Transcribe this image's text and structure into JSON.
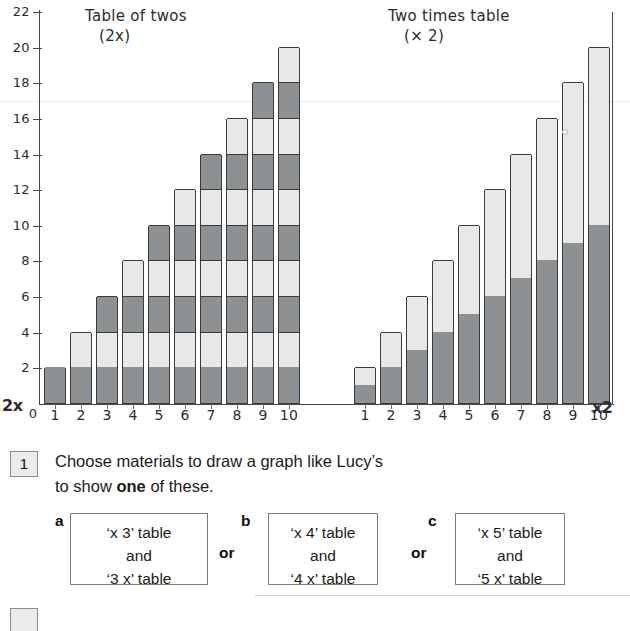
{
  "chart_data": {
    "type": "bar",
    "panels": [
      {
        "title_line1": "Table of twos",
        "title_line2": "(2x)",
        "axis_tag": "2x",
        "categories": [
          "1",
          "2",
          "3",
          "4",
          "5",
          "6",
          "7",
          "8",
          "9",
          "10"
        ],
        "values": [
          2,
          4,
          6,
          8,
          10,
          12,
          14,
          16,
          18,
          20
        ],
        "segment_size": 2,
        "segment_style": "alternating-blocks-of-2",
        "xlabel": "2x",
        "ylabel": "",
        "ylim": [
          0,
          22
        ]
      },
      {
        "title_line1": "Two times table",
        "title_line2": "(× 2)",
        "axis_tag": "x2",
        "categories": [
          "1",
          "2",
          "3",
          "4",
          "5",
          "6",
          "7",
          "8",
          "9",
          "10"
        ],
        "values": [
          2,
          4,
          6,
          8,
          10,
          12,
          14,
          16,
          18,
          20
        ],
        "split_at": "half",
        "segment_style": "dark-lower-half-light-upper-half",
        "xlabel": "×2",
        "ylabel": "",
        "ylim": [
          0,
          22
        ]
      }
    ],
    "yticks": [
      0,
      2,
      4,
      6,
      8,
      10,
      12,
      14,
      16,
      18,
      20,
      22
    ],
    "ytick_labels": [
      "0",
      "2",
      "4",
      "6",
      "8",
      "10",
      "12",
      "14",
      "16",
      "18",
      "20",
      "22"
    ],
    "grid": false,
    "legend": "none",
    "colors": {
      "bar_dark": "#8e9194",
      "bar_light": "#e8e9e6",
      "axis": "#4a4a4a",
      "outline": "#3b3b3b"
    }
  },
  "chart": {
    "zero_label": "0",
    "left": {
      "title_line1": "Table of twos",
      "title_line2": "(2x)",
      "axis_tag": "2x"
    },
    "right": {
      "title_line1": "Two times table",
      "title_line2": "(× 2)",
      "axis_tag": "x2"
    }
  },
  "question": {
    "number": "1",
    "text_line1": "Choose materials to draw a graph like Lucy’s",
    "text_line2_pre": "to show ",
    "text_line2_bold": "one",
    "text_line2_post": " of these.",
    "or_label_1": "or",
    "or_label_2": "or",
    "options": [
      {
        "letter": "a",
        "line1": "‘x 3’ table",
        "line2": "and",
        "line3": "‘3 x’ table"
      },
      {
        "letter": "b",
        "line1": "‘x 4’ table",
        "line2": "and",
        "line3": "‘4 x’ table"
      },
      {
        "letter": "c",
        "line1": "‘x 5’ table",
        "line2": "and",
        "line3": "‘5 x’ table"
      }
    ]
  }
}
